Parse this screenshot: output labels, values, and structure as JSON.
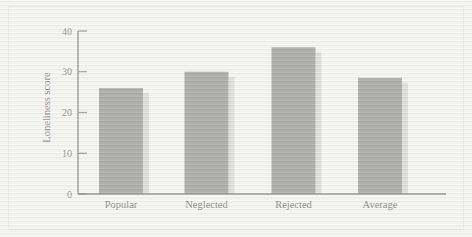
{
  "chart_data": {
    "type": "bar",
    "title": "",
    "subtitle": "",
    "xlabel": "",
    "ylabel": "Loneliness score",
    "categories": [
      "Popular",
      "Neglected",
      "Rejected",
      "Average"
    ],
    "values": [
      26,
      30,
      36,
      28.5
    ],
    "series": [
      {
        "name": "Loneliness score",
        "values": [
          26,
          30,
          36,
          28.5
        ]
      }
    ],
    "ylim": [
      0,
      40
    ],
    "y_ticks": [
      0,
      10,
      20,
      30,
      40
    ],
    "y_tick_labels": [
      "0",
      "10",
      "20",
      "30",
      "40"
    ],
    "grid": false,
    "legend": false,
    "legend_position": "none",
    "annotations": [],
    "bar_color": "#6e6e6e",
    "axis_color": "#4a4a4a",
    "background_color": "#f2f2f0"
  },
  "figure": {
    "border_color": "#dcdcd8",
    "texture": "scanned-horizontal-scanlines"
  }
}
